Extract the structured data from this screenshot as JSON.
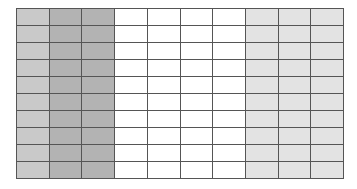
{
  "grid": {
    "rows": 10,
    "columns": 10,
    "column_fills": [
      "#c9c9c9",
      "#b3b3b3",
      "#b3b3b3",
      "#ffffff",
      "#ffffff",
      "#ffffff",
      "#ffffff",
      "#e3e3e3",
      "#e3e3e3",
      "#e3e3e3"
    ],
    "column_groups": [
      {
        "label": "",
        "columns": 1,
        "color": "#c9c9c9"
      },
      {
        "label": "",
        "columns": 2,
        "color": "#b3b3b3"
      },
      {
        "label": "",
        "columns": 4,
        "color": "#ffffff"
      },
      {
        "label": "",
        "columns": 3,
        "color": "#e3e3e3"
      }
    ],
    "line_color": "#555555"
  }
}
